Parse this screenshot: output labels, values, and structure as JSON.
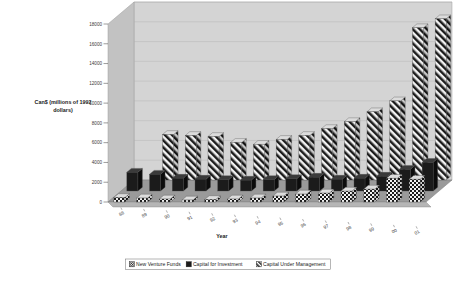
{
  "chart_data": {
    "type": "bar",
    "title": "",
    "subtitle": "",
    "xlabel": "Year",
    "ylabel": "Can$ (millions of 1992 dollars)",
    "categories": [
      "88",
      "89",
      "90",
      "91",
      "92",
      "93",
      "94",
      "95",
      "96",
      "97",
      "98",
      "99",
      "00",
      "01"
    ],
    "ylim": [
      0,
      18000
    ],
    "yticks": [
      0,
      2000,
      4000,
      6000,
      8000,
      10000,
      12000,
      14000,
      16000,
      18000
    ],
    "ytick_labels": [
      "0",
      "2000",
      "4000",
      "6000",
      "8000",
      "10000",
      "12000",
      "14000",
      "16000",
      "18000"
    ],
    "grid": true,
    "legend_position": "bottom",
    "projection": "3d-rows",
    "series": [
      {
        "name": "New Venture Funds",
        "pattern": "checker",
        "row": "front",
        "values": [
          450,
          400,
          300,
          200,
          250,
          300,
          400,
          600,
          800,
          900,
          1100,
          1300,
          2400,
          2300
        ]
      },
      {
        "name": "Capital for Investment",
        "pattern": "solid-black",
        "row": "middle",
        "values": [
          1900,
          1700,
          1300,
          1200,
          1150,
          1100,
          1150,
          1250,
          1400,
          1200,
          1300,
          1500,
          2200,
          2900
        ]
      },
      {
        "name": "Capital Under Management",
        "pattern": "diagonal-stripe",
        "row": "back",
        "values": [
          0,
          4600,
          4500,
          4400,
          3800,
          3600,
          4100,
          4500,
          5200,
          5900,
          6900,
          8000,
          15400,
          16300
        ]
      }
    ]
  },
  "legend": {
    "items": [
      {
        "label": "New Venture Funds",
        "swatch": "checker"
      },
      {
        "label": "Capital for Investment",
        "swatch": "solid-black"
      },
      {
        "label": "Capital Under Management",
        "swatch": "diagonal-stripe"
      }
    ]
  },
  "colors": {
    "wall_back": "#d4d4d4",
    "wall_left": "#c2c2c2",
    "floor": "#9a9a9a",
    "floor_front": "#b5b5b5",
    "gridline": "#b0b0b0",
    "bar_dark": "#1b1b1b",
    "bar_light": "#f2f2f2",
    "outline": "#4a4a4a",
    "text": "#1a1a1a",
    "background": "#ffffff"
  }
}
